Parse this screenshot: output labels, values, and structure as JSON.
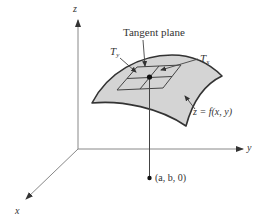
{
  "figure": {
    "type": "diagram",
    "colors": {
      "axis": "#777777",
      "surface_fill": "#d4d4d4",
      "surface_edge": "#333333",
      "plane_edge": "#444444",
      "point": "#111111",
      "text": "#333333"
    },
    "axes": {
      "z_label": "z",
      "y_label": "y",
      "x_label": "x"
    },
    "labels": {
      "tangent_plane": "Tangent plane",
      "t_y_main": "T",
      "t_y_sub": "y",
      "t_x_main": "T",
      "t_x_sub": "x",
      "surface_equation": "z = f(x, y)",
      "base_point": "(a, b, 0)"
    }
  }
}
